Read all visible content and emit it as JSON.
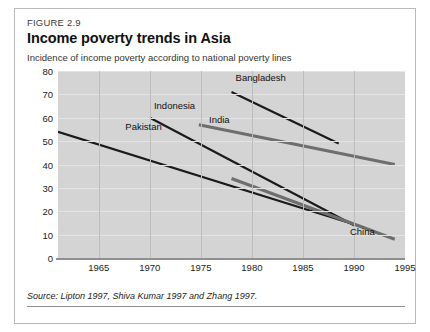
{
  "figure": {
    "number": "FIGURE 2.9",
    "title": "Income poverty trends in Asia",
    "subtitle": "Incidence of income poverty according to national poverty lines",
    "source": "Source: Lipton 1997, Shiva Kumar 1997 and Zhang 1997."
  },
  "colors": {
    "plot_background": "#d4d4d4",
    "dark_series": "#1a1a1a",
    "gray_series": "#6e6e6e",
    "gridline_vertical": "#bdbdbd",
    "gridline_horizontal": "#e4e4e4",
    "axis_rule": "#8f8f8f",
    "card_border": "#b9b9b9"
  },
  "chart_data": {
    "type": "line",
    "title": "Income poverty trends in Asia",
    "subtitle": "Incidence of income poverty according to national poverty lines",
    "xlabel": "",
    "ylabel": "",
    "xlim": [
      1961,
      1995
    ],
    "ylim": [
      0,
      80
    ],
    "yticks": [
      0,
      10,
      20,
      30,
      40,
      50,
      60,
      70,
      80
    ],
    "ytick_labels": [
      "0",
      "10",
      "20",
      "30",
      "40",
      "50",
      "60",
      "70",
      "80"
    ],
    "xticks": [
      1965,
      1970,
      1975,
      1980,
      1985,
      1990,
      1995
    ],
    "xtick_labels": [
      "1965",
      "1970",
      "1975",
      "1980",
      "1985",
      "1990",
      "1995"
    ],
    "grid": "both",
    "legend": "inline-labels",
    "series": [
      {
        "name": "Pakistan",
        "color": "#1a1a1a",
        "style": "thin-dark",
        "label_x": 1967.6,
        "label_y": 55.5,
        "x": [
          1961,
          1991
        ],
        "y": [
          54,
          13
        ],
        "points": [
          {
            "year": 1961,
            "value": 54
          },
          {
            "year": 1991,
            "value": 13
          }
        ]
      },
      {
        "name": "Indonesia",
        "color": "#1a1a1a",
        "style": "thin-dark",
        "label_x": 1970.4,
        "label_y": 64.5,
        "x": [
          1970,
          1990
        ],
        "y": [
          60,
          14
        ],
        "points": [
          {
            "year": 1970,
            "value": 60
          },
          {
            "year": 1990,
            "value": 14
          }
        ]
      },
      {
        "name": "Bangladesh",
        "color": "#1a1a1a",
        "style": "thin-dark",
        "label_x": 1978.4,
        "label_y": 76.5,
        "x": [
          1978,
          1988.5
        ],
        "y": [
          71,
          49
        ],
        "points": [
          {
            "year": 1978,
            "value": 71
          },
          {
            "year": 1988.5,
            "value": 49
          }
        ]
      },
      {
        "name": "India",
        "color": "#6e6e6e",
        "style": "thick-gray",
        "label_x": 1975.8,
        "label_y": 58.5,
        "x": [
          1974.8,
          1994
        ],
        "y": [
          57,
          40
        ],
        "points": [
          {
            "year": 1974.8,
            "value": 57
          },
          {
            "year": 1994,
            "value": 40
          }
        ]
      },
      {
        "name": "China",
        "color": "#6e6e6e",
        "style": "thick-gray",
        "label_x": 1989.6,
        "label_y": 10.5,
        "x": [
          1978,
          1994
        ],
        "y": [
          34,
          8
        ],
        "points": [
          {
            "year": 1978,
            "value": 34
          },
          {
            "year": 1994,
            "value": 8
          }
        ]
      }
    ]
  }
}
